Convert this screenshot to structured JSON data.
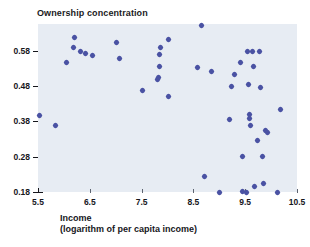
{
  "chart_data": {
    "type": "scatter",
    "title": "Ownership concentration",
    "xlabel": "Income",
    "xlabel_sub": "(logarithm of per capita income)",
    "ylabel": "Ownership concentration",
    "xlim": [
      5.5,
      10.5
    ],
    "ylim": [
      0.18,
      0.655
    ],
    "xticks": [
      5.5,
      6.5,
      7.5,
      8.5,
      9.5,
      10.5
    ],
    "xtick_labels": [
      "5.5",
      "6.5",
      "7.5",
      "8.5",
      "9.5",
      "10.5"
    ],
    "yticks": [
      0.18,
      0.28,
      0.38,
      0.48,
      0.58
    ],
    "ytick_labels": [
      "0.18",
      "0.28",
      "0.38",
      "0.48",
      "0.58"
    ],
    "grid": false,
    "legend": false,
    "marker": "diamond",
    "marker_color": "#4a52a3",
    "plot_background": "#e7ecf3",
    "points": [
      {
        "x": 5.52,
        "y": 0.395
      },
      {
        "x": 5.84,
        "y": 0.367
      },
      {
        "x": 6.05,
        "y": 0.545
      },
      {
        "x": 6.19,
        "y": 0.588
      },
      {
        "x": 6.21,
        "y": 0.618
      },
      {
        "x": 6.33,
        "y": 0.577
      },
      {
        "x": 6.42,
        "y": 0.572
      },
      {
        "x": 6.56,
        "y": 0.566
      },
      {
        "x": 7.01,
        "y": 0.603
      },
      {
        "x": 7.07,
        "y": 0.558
      },
      {
        "x": 7.52,
        "y": 0.468
      },
      {
        "x": 7.81,
        "y": 0.497
      },
      {
        "x": 7.83,
        "y": 0.503
      },
      {
        "x": 7.84,
        "y": 0.535
      },
      {
        "x": 7.85,
        "y": 0.57
      },
      {
        "x": 7.87,
        "y": 0.588
      },
      {
        "x": 8.02,
        "y": 0.612
      },
      {
        "x": 8.01,
        "y": 0.45
      },
      {
        "x": 8.66,
        "y": 0.652
      },
      {
        "x": 8.57,
        "y": 0.533
      },
      {
        "x": 8.71,
        "y": 0.224
      },
      {
        "x": 8.84,
        "y": 0.52
      },
      {
        "x": 9.0,
        "y": 0.18
      },
      {
        "x": 9.19,
        "y": 0.384
      },
      {
        "x": 9.24,
        "y": 0.477
      },
      {
        "x": 9.3,
        "y": 0.513
      },
      {
        "x": 9.4,
        "y": 0.545
      },
      {
        "x": 9.44,
        "y": 0.28
      },
      {
        "x": 9.45,
        "y": 0.182
      },
      {
        "x": 9.53,
        "y": 0.18
      },
      {
        "x": 9.55,
        "y": 0.578
      },
      {
        "x": 9.57,
        "y": 0.483
      },
      {
        "x": 9.58,
        "y": 0.4
      },
      {
        "x": 9.59,
        "y": 0.387
      },
      {
        "x": 9.61,
        "y": 0.367
      },
      {
        "x": 9.64,
        "y": 0.578
      },
      {
        "x": 9.66,
        "y": 0.535
      },
      {
        "x": 9.68,
        "y": 0.195
      },
      {
        "x": 9.73,
        "y": 0.325
      },
      {
        "x": 9.78,
        "y": 0.578
      },
      {
        "x": 9.8,
        "y": 0.476
      },
      {
        "x": 9.83,
        "y": 0.281
      },
      {
        "x": 9.86,
        "y": 0.205
      },
      {
        "x": 9.9,
        "y": 0.355
      },
      {
        "x": 9.93,
        "y": 0.348
      },
      {
        "x": 10.12,
        "y": 0.18
      },
      {
        "x": 10.18,
        "y": 0.412
      }
    ]
  }
}
